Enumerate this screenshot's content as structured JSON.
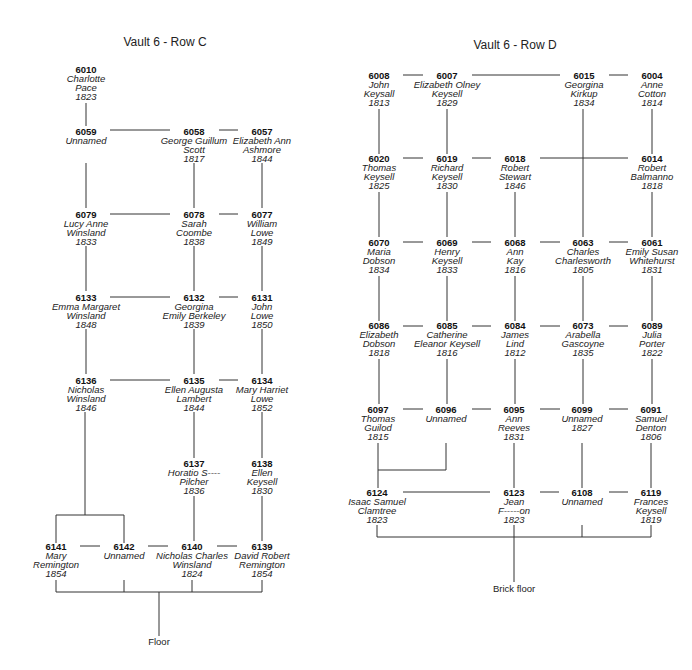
{
  "panels": [
    {
      "title": "Vault 6 - Row C",
      "floor_label": "Floor",
      "nodes": [
        {
          "id": "6010",
          "lines": [
            "Charlotte",
            "Pace",
            "1823"
          ]
        },
        {
          "id": "6059",
          "lines": [
            "Unnamed"
          ]
        },
        {
          "id": "6058",
          "lines": [
            "George Guillum",
            "Scott",
            "1817"
          ]
        },
        {
          "id": "6057",
          "lines": [
            "Elizabeth Ann",
            "Ashmore",
            "1844"
          ]
        },
        {
          "id": "6079",
          "lines": [
            "Lucy Anne",
            "Winsland",
            "1833"
          ]
        },
        {
          "id": "6078",
          "lines": [
            "Sarah",
            "Coombe",
            "1838"
          ]
        },
        {
          "id": "6077",
          "lines": [
            "William",
            "Lowe",
            "1849"
          ]
        },
        {
          "id": "6133",
          "lines": [
            "Emma Margaret",
            "Winsland",
            "1848"
          ]
        },
        {
          "id": "6132",
          "lines": [
            "Georgina",
            "Emily Berkeley",
            "1839"
          ]
        },
        {
          "id": "6131",
          "lines": [
            "John",
            "Lowe",
            "1850"
          ]
        },
        {
          "id": "6136",
          "lines": [
            "Nicholas",
            "Winsland",
            "1846"
          ]
        },
        {
          "id": "6135",
          "lines": [
            "Ellen Augusta",
            "Lambert",
            "1844"
          ]
        },
        {
          "id": "6134",
          "lines": [
            "Mary Harriet",
            "Lowe",
            "1852"
          ]
        },
        {
          "id": "6137",
          "lines": [
            "Horatio S----",
            "Pilcher",
            "1836"
          ]
        },
        {
          "id": "6138",
          "lines": [
            "Ellen",
            "Keysell",
            "1830"
          ]
        },
        {
          "id": "6141",
          "lines": [
            "Mary",
            "Remington",
            "1854"
          ]
        },
        {
          "id": "6142",
          "lines": [
            "Unnamed"
          ]
        },
        {
          "id": "6140",
          "lines": [
            "Nicholas Charles",
            "Winsland",
            "1824"
          ]
        },
        {
          "id": "6139",
          "lines": [
            "David Robert",
            "Remington",
            "1854"
          ]
        }
      ]
    },
    {
      "title": "Vault 6 - Row D",
      "floor_label": "Brick floor",
      "nodes": [
        {
          "id": "6008",
          "lines": [
            "John",
            "Keysall",
            "1813"
          ]
        },
        {
          "id": "6007",
          "lines": [
            "Elizabeth Olney",
            "Keysell",
            "1829"
          ]
        },
        {
          "id": "6015",
          "lines": [
            "Georgina",
            "Kirkup",
            "1834"
          ]
        },
        {
          "id": "6004",
          "lines": [
            "Anne",
            "Cotton",
            "1814"
          ]
        },
        {
          "id": "6020",
          "lines": [
            "Thomas",
            "Keysell",
            "1825"
          ]
        },
        {
          "id": "6019",
          "lines": [
            "Richard",
            "Keysell",
            "1830"
          ]
        },
        {
          "id": "6018",
          "lines": [
            "Robert",
            "Stewart",
            "1846"
          ]
        },
        {
          "id": "6014",
          "lines": [
            "Robert",
            "Balmanno",
            "1818"
          ]
        },
        {
          "id": "6070",
          "lines": [
            "Maria",
            "Dobson",
            "1834"
          ]
        },
        {
          "id": "6069",
          "lines": [
            "Henry",
            "Keysell",
            "1833"
          ]
        },
        {
          "id": "6068",
          "lines": [
            "Ann",
            "Kay",
            "1816"
          ]
        },
        {
          "id": "6063",
          "lines": [
            "Charles",
            "Charlesworth",
            "1805"
          ]
        },
        {
          "id": "6061",
          "lines": [
            "Emily Susan",
            "Whitehurst",
            "1831"
          ]
        },
        {
          "id": "6086",
          "lines": [
            "Elizabeth",
            "Dobson",
            "1818"
          ]
        },
        {
          "id": "6085",
          "lines": [
            "Catherine",
            "Eleanor Keysell",
            "1816"
          ]
        },
        {
          "id": "6084",
          "lines": [
            "James",
            "Lind",
            "1812"
          ]
        },
        {
          "id": "6073",
          "lines": [
            "Arabella",
            "Gascoyne",
            "1835"
          ]
        },
        {
          "id": "6089",
          "lines": [
            "Julia",
            "Porter",
            "1822"
          ]
        },
        {
          "id": "6097",
          "lines": [
            "Thomas",
            "Guilod",
            "1815"
          ]
        },
        {
          "id": "6096",
          "lines": [
            "Unnamed"
          ]
        },
        {
          "id": "6095",
          "lines": [
            "Ann",
            "Reeves",
            "1831"
          ]
        },
        {
          "id": "6099",
          "lines": [
            "Unnamed",
            "1827"
          ]
        },
        {
          "id": "6091",
          "lines": [
            "Samuel",
            "Denton",
            "1806"
          ]
        },
        {
          "id": "6124",
          "lines": [
            "Isaac Samuel",
            "Clamtree",
            "1823"
          ]
        },
        {
          "id": "6123",
          "lines": [
            "Jean",
            "F-----on",
            "1823"
          ]
        },
        {
          "id": "6108",
          "lines": [
            "Unnamed"
          ]
        },
        {
          "id": "6119",
          "lines": [
            "Frances",
            "Keysell",
            "1819"
          ]
        }
      ]
    }
  ],
  "colors": {
    "line": "#333333",
    "text": "#1a1a1a",
    "background": "#ffffff"
  }
}
